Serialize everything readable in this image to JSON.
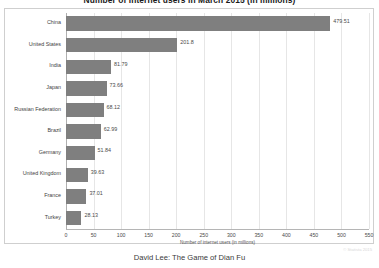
{
  "chart_data": {
    "type": "bar",
    "orientation": "horizontal",
    "title": "Number of internet users in March 2015 (in millions)",
    "xlabel": "Number of internet users (in millions)",
    "ylabel": "",
    "xlim": [
      0,
      550
    ],
    "xticks": [
      0,
      50,
      100,
      150,
      200,
      250,
      300,
      350,
      400,
      450,
      500,
      550
    ],
    "xtick_labels": [
      "0",
      "50",
      "100",
      "150",
      "200",
      "250",
      "300",
      "350",
      "400",
      "450",
      "500",
      "550"
    ],
    "grid": true,
    "legend": "none",
    "bar_color": "#7f7f7f",
    "categories": [
      "China",
      "United States",
      "India",
      "Japan",
      "Russian Federation",
      "Brazil",
      "Germany",
      "United Kingdom",
      "France",
      "Turkey"
    ],
    "values": [
      479.51,
      201.8,
      81.79,
      73.66,
      68.12,
      62.99,
      51.84,
      39.63,
      37.01,
      28.13
    ],
    "value_labels": [
      "479.51",
      "201.8",
      "81.79",
      "73.66",
      "68.12",
      "62.99",
      "51.84",
      "39.63",
      "37.01",
      "28.13"
    ]
  },
  "watermark": "© Statista 2015",
  "caption": "David Lee: The Game of Dian Fu"
}
